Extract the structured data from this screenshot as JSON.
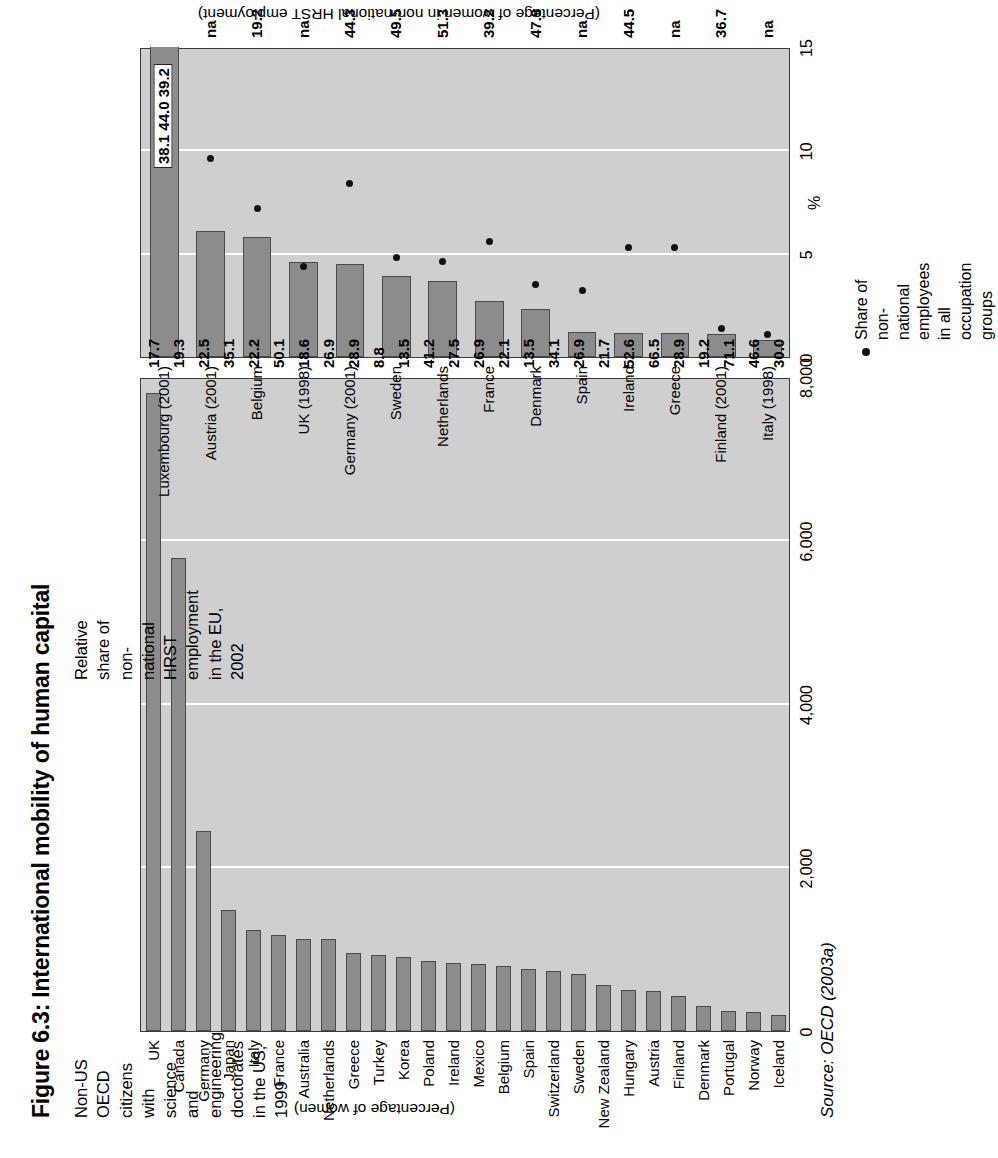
{
  "figure": {
    "title": "Figure 6.3: International mobility of human capital",
    "source": "Source: OECD (2003a)"
  },
  "left_chart": {
    "subtitle": "Non-US OECD citizens with science and\nengineering doctorates in the US, 1999",
    "value_axis_title": "(Percentage of women)",
    "ticks": [
      "0",
      "2,000",
      "4,000",
      "6,000",
      "8,000"
    ]
  },
  "right_chart": {
    "subtitle": "Relative share of non-national\nHRST employment in the EU, 2002",
    "value_axis_title": "(Percentage of women in non-national HRST employment)",
    "axis_unit": "%",
    "ticks": [
      "0",
      "5",
      "10",
      "15"
    ],
    "legend_text": "Share of non-national employees in all\noccupation groups"
  },
  "chart_data": [
    {
      "type": "bar",
      "id": "left",
      "title": "Non-US OECD citizens with science and engineering doctorates in the US, 1999",
      "orientation": "horizontal",
      "xlabel": "",
      "ylabel": "(Percentage of women)",
      "xlim": [
        0,
        8000
      ],
      "xticks": [
        0,
        2000,
        4000,
        6000,
        8000
      ],
      "xticklabels": [
        "0",
        "2,000",
        "4,000",
        "6,000",
        "8,000"
      ],
      "grid": true,
      "categories": [
        "UK",
        "Canada",
        "Germany",
        "Japan",
        "Italy",
        "France",
        "Australia",
        "Netherlands",
        "Greece",
        "Turkey",
        "Korea",
        "Poland",
        "Ireland",
        "Mexico",
        "Belgium",
        "Spain",
        "Switzerland",
        "Sweden",
        "New Zealand",
        "Hungary",
        "Austria",
        "Finland",
        "Denmark",
        "Portugal",
        "Norway",
        "Iceland"
      ],
      "values": [
        7800,
        5780,
        2450,
        1480,
        1240,
        1180,
        1120,
        1130,
        950,
        930,
        900,
        860,
        830,
        820,
        790,
        760,
        740,
        700,
        560,
        500,
        490,
        430,
        300,
        250,
        230,
        190
      ],
      "data_labels": [
        "17.7",
        "19.3",
        "22.5",
        "35.1",
        "22.2",
        "50.1",
        "18.6",
        "26.9",
        "28.9",
        "8.8",
        "13.5",
        "41.2",
        "27.5",
        "26.9",
        "22.1",
        "13.5",
        "34.1",
        "26.9",
        "21.7",
        "52.6",
        "66.5",
        "28.9",
        "19.2",
        "71.1",
        "46.6",
        "30.0"
      ],
      "data_label_meaning": "Percentage of women"
    },
    {
      "type": "bar",
      "id": "right",
      "title": "Relative share of non-national HRST employment in the EU, 2002",
      "orientation": "horizontal",
      "xlabel": "%",
      "ylabel": "(Percentage of women in non-national HRST employment)",
      "xlim": [
        0,
        15
      ],
      "xticks": [
        0,
        5,
        10,
        15
      ],
      "xticklabels": [
        "0",
        "5",
        "10",
        "15"
      ],
      "grid": true,
      "categories": [
        "Luxembourg (2001)",
        "Austria (2001)",
        "Belgium",
        "UK (1998)",
        "Germany (2001)",
        "Sweden",
        "Netherlands",
        "France",
        "Denmark",
        "Spain",
        "Ireland",
        "Greece",
        "Finland (2001)",
        "Italy (1998)"
      ],
      "series": [
        {
          "name": "Relative share of non-national HRST employment",
          "values": [
            16.5,
            6.1,
            5.8,
            4.6,
            4.5,
            3.9,
            3.7,
            2.7,
            2.3,
            1.2,
            1.15,
            1.15,
            1.1,
            0.8
          ]
        },
        {
          "name": "Share of non-national employees in all occupation groups",
          "values": [
            null,
            9.6,
            7.2,
            4.4,
            8.4,
            4.8,
            4.6,
            5.6,
            3.5,
            3.2,
            5.3,
            5.3,
            1.4,
            1.1
          ]
        }
      ],
      "data_labels": [
        "38.1  44.0  39.2",
        "na",
        "19.2",
        "na",
        "44.3",
        "49.5",
        "51.3",
        "39.2",
        "47.9",
        "na",
        "44.5",
        "na",
        "36.7",
        "na"
      ],
      "data_label_meaning": "Percentage of women in non-national HRST employment",
      "luxembourg_labels": [
        "38.1",
        "44.0",
        "39.2"
      ]
    }
  ]
}
